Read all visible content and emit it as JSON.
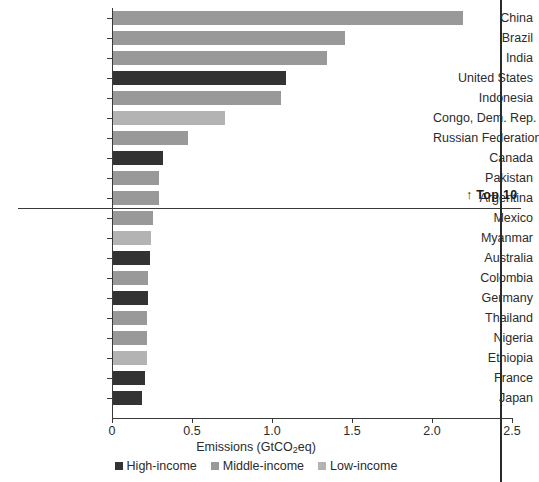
{
  "chart_data": {
    "type": "bar",
    "orientation": "horizontal",
    "title": "",
    "xlabel": "Emissions (GtCO2eq)",
    "xlabel_parts": {
      "pre": "Emissions (GtCO",
      "sub": "2",
      "post": "eq)"
    },
    "ylabel": "",
    "xlim": [
      0,
      2.5
    ],
    "xticks": [
      0,
      0.5,
      1.0,
      1.5,
      2.0,
      2.5
    ],
    "xticklabels": [
      "0",
      "0.5",
      "1.0",
      "1.5",
      "2.0",
      "2.5"
    ],
    "grid": false,
    "legend_position": "bottom-center",
    "categories": [
      "China",
      "Brazil",
      "India",
      "United States",
      "Indonesia",
      "Congo, Dem. Rep.",
      "Russian Federation",
      "Canada",
      "Pakistan",
      "Argentina",
      "Mexico",
      "Myanmar",
      "Australia",
      "Colombia",
      "Germany",
      "Thailand",
      "Nigeria",
      "Ethiopia",
      "France",
      "Japan"
    ],
    "values": [
      2.19,
      1.45,
      1.34,
      1.08,
      1.05,
      0.7,
      0.47,
      0.31,
      0.29,
      0.29,
      0.25,
      0.24,
      0.23,
      0.22,
      0.22,
      0.21,
      0.21,
      0.21,
      0.2,
      0.18
    ],
    "groups": [
      "Middle-income",
      "Middle-income",
      "Middle-income",
      "High-income",
      "Middle-income",
      "Low-income",
      "Middle-income",
      "High-income",
      "Middle-income",
      "Middle-income",
      "Middle-income",
      "Low-income",
      "High-income",
      "Middle-income",
      "High-income",
      "Middle-income",
      "Middle-income",
      "Low-income",
      "High-income",
      "High-income"
    ],
    "series": [
      {
        "name": "High-income",
        "color": "#333333"
      },
      {
        "name": "Middle-income",
        "color": "#999999"
      },
      {
        "name": "Low-income",
        "color": "#b3b3b3"
      }
    ],
    "annotations": [
      {
        "name": "top-10-divider",
        "label": "Top 10",
        "arrow": "↑",
        "after_category": "Argentina"
      },
      {
        "name": "reference-line",
        "value": 2.43
      }
    ]
  },
  "legend": {
    "items": [
      {
        "label": "High-income",
        "color": "#333333"
      },
      {
        "label": "Middle-income",
        "color": "#999999"
      },
      {
        "label": "Low-income",
        "color": "#b3b3b3"
      }
    ]
  },
  "annotation": {
    "top10_arrow": "↑",
    "top10_text": "Top 10"
  }
}
